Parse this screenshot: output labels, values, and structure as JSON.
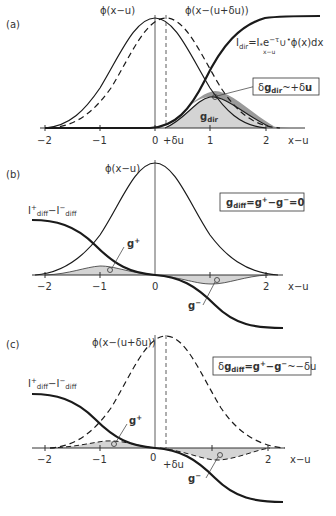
{
  "figure": {
    "panels": [
      {
        "id": "a",
        "label": "(a)",
        "curve_labels": {
          "phi": "ϕ(x−u)",
          "phi_shift": "ϕ(x−(u+δu))",
          "formula_main": "I",
          "formula_sub": "dir",
          "formula_rest": "=I",
          "formula_star": "*",
          "formula_exp": "e",
          "formula_tau": "−τ",
          "formula_U": "∪",
          "formula_lim": "x−u",
          "formula_end": "ϕ(x)dx",
          "g_dir": "g",
          "g_dir_sub": "dir"
        },
        "box": {
          "prefix": "δ",
          "g": "g",
          "sub": "dir",
          "rest": "~+δ",
          "u": "u"
        },
        "ticks": [
          "−2",
          "−1",
          "0",
          "+δu",
          "1",
          "2"
        ],
        "axis_label": "x−u"
      },
      {
        "id": "b",
        "label": "(b)",
        "curve_labels": {
          "phi": "ϕ(x−u)",
          "I_plus": "I",
          "sup_plus": "+",
          "diff": "diff",
          "minus": "−I",
          "sup_minus": "−",
          "g_plus": "g",
          "g_plus_sup": "+",
          "g_minus": "g",
          "g_minus_sup": "−"
        },
        "box": {
          "g": "g",
          "sub": "diff",
          "rest": "=g",
          "sup1": "+",
          "mid": "−g",
          "sup2": "−",
          "end": "=0"
        },
        "ticks": [
          "−2",
          "−1",
          "0",
          "2"
        ],
        "axis_label": "x−u"
      },
      {
        "id": "c",
        "label": "(c)",
        "curve_labels": {
          "phi_shift": "ϕ(x−(u+δu))",
          "I_plus": "I",
          "sup_plus": "+",
          "diff": "diff",
          "minus": "−I",
          "sup_minus": "−",
          "g_plus": "g",
          "g_plus_sup": "+",
          "g_minus": "g",
          "g_minus_sup": "−"
        },
        "box": {
          "prefix": "δ",
          "g": "g",
          "sub": "diff",
          "rest": "=g",
          "sup1": "+",
          "mid": "−g",
          "sup2": "−",
          "end": "~−δu"
        },
        "ticks": [
          "−2",
          "−1",
          "0",
          "+δu",
          "2"
        ],
        "axis_label": "x−u"
      }
    ]
  },
  "colors": {
    "curve": "#1a1a1a",
    "fill_light": "#d4d4d4",
    "fill_dark": "#9a9a9a",
    "axis": "#333333"
  }
}
